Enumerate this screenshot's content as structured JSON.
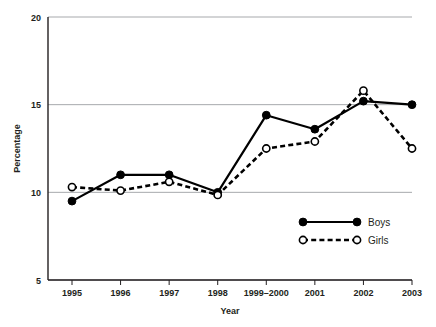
{
  "chart_data": {
    "type": "line",
    "title": "",
    "xlabel": "Year",
    "ylabel": "Percentage",
    "categories": [
      "1995",
      "1996",
      "1997",
      "1998",
      "1999–2000",
      "2001",
      "2002",
      "2003"
    ],
    "ylim": [
      5,
      20
    ],
    "yticks": [
      5,
      10,
      15,
      20
    ],
    "ytick_labels": [
      "5",
      "10",
      "15",
      "20"
    ],
    "grid": "horizontal",
    "legend_position": "inside-bottom-right",
    "series": [
      {
        "name": "Boys",
        "marker": "filled-circle",
        "line_style": "solid",
        "color": "#000000",
        "values": [
          9.5,
          11.0,
          11.0,
          10.0,
          14.4,
          13.6,
          15.2,
          15.0
        ]
      },
      {
        "name": "Girls",
        "marker": "open-circle",
        "line_style": "dashed",
        "color": "#000000",
        "values": [
          10.3,
          10.1,
          10.6,
          9.85,
          12.5,
          12.9,
          15.8,
          12.5
        ]
      }
    ]
  },
  "axes": {
    "y_title": "Percentage",
    "x_title": "Year"
  },
  "legend": {
    "items": [
      {
        "label": "Boys"
      },
      {
        "label": "Girls"
      }
    ]
  }
}
